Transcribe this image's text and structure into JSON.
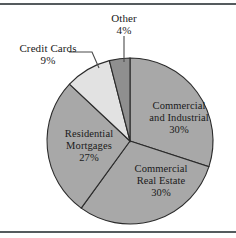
{
  "figure": {
    "frame_color": "#555b5e",
    "background": "#ffffff"
  },
  "chart_data": {
    "type": "pie",
    "title": "",
    "subtitle": "",
    "xlabel": "",
    "ylabel": "",
    "legend_position": "none",
    "grid": false,
    "start_angle_deg": 0,
    "direction": "clockwise",
    "categories": [
      "Commercial and Industrial",
      "Commercial Real Estate",
      "Residential Mortgages",
      "Credit Cards",
      "Other"
    ],
    "values": [
      30,
      30,
      27,
      9,
      4
    ],
    "value_labels": [
      "30%",
      "30%",
      "27%",
      "9%",
      "4%"
    ],
    "units": "percent",
    "slice_colors": [
      "#a8a8a8",
      "#a8a8a8",
      "#a8a8a8",
      "#e2e2e2",
      "#8f8f8f"
    ],
    "slice_edge_color": "#2b2b2b",
    "label_placement": [
      "inside",
      "inside",
      "inside",
      "outside",
      "outside"
    ]
  },
  "labels": {
    "other": {
      "line1": "Other",
      "line2": "4%"
    },
    "credit_cards": {
      "line1": "Credit Cards",
      "line2": "9%"
    },
    "commercial_industrial": {
      "line1": "Commercial",
      "line2": "and Industrial",
      "line3": "30%"
    },
    "commercial_real_estate": {
      "line1": "Commercial",
      "line2": "Real Estate",
      "line3": "30%"
    },
    "residential_mortgages": {
      "line1": "Residential",
      "line2": "Mortgages",
      "line3": "27%"
    }
  }
}
